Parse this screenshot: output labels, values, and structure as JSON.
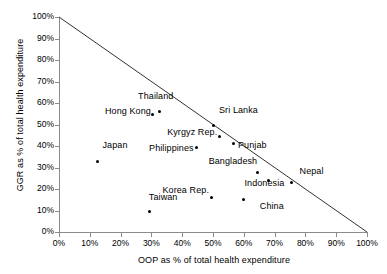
{
  "chart_data": {
    "type": "scatter",
    "title": "",
    "xlabel": "OOP as % of total health expenditure",
    "ylabel": "GGR as % of total health expenditure",
    "xlim": [
      0,
      100
    ],
    "ylim": [
      0,
      100
    ],
    "grid": false,
    "legend": "none",
    "xticks": [
      "0%",
      "10%",
      "20%",
      "30%",
      "40%",
      "50%",
      "60%",
      "70%",
      "80%",
      "90%",
      "100%"
    ],
    "xtick_values": [
      0,
      10,
      20,
      30,
      40,
      50,
      60,
      70,
      80,
      90,
      100
    ],
    "yticks": [
      "0%",
      "10%",
      "20%",
      "30%",
      "40%",
      "50%",
      "60%",
      "70%",
      "80%",
      "90%",
      "100%"
    ],
    "ytick_values": [
      0,
      10,
      20,
      30,
      40,
      50,
      60,
      70,
      80,
      90,
      100
    ],
    "annotations": [
      {
        "type": "line",
        "name": "sum-equals-100-line",
        "x": [
          0,
          100
        ],
        "y": [
          100,
          0
        ],
        "color": "#333333"
      }
    ],
    "points": [
      {
        "label": "Japan",
        "x": 12.5,
        "y": 33.0,
        "label_dx": -30,
        "label_dy": -16
      },
      {
        "label": "Taiwan",
        "x": 29.5,
        "y": 9.5,
        "label_dx": -32,
        "label_dy": -15
      },
      {
        "label": "Hong Kong",
        "x": 30.5,
        "y": 54.5,
        "label_dx": -62,
        "label_dy": -4
      },
      {
        "label": "Thailand",
        "x": 32.5,
        "y": 56.0,
        "label_dx": -46,
        "label_dy": -16
      },
      {
        "label": "Philippines",
        "x": 44.5,
        "y": 39.5,
        "label_dx": -62,
        "label_dy": 1
      },
      {
        "label": "Korea Rep.",
        "x": 49.5,
        "y": 16.0,
        "label_dx": -62,
        "label_dy": -8
      },
      {
        "label": "Sri Lanka",
        "x": 50.0,
        "y": 49.5,
        "label_dx": 6,
        "label_dy": -16
      },
      {
        "label": "Kyrgyz Rep.",
        "x": 52.0,
        "y": 44.5,
        "label_dx": -62,
        "label_dy": -4
      },
      {
        "label": "Punjab",
        "x": 56.5,
        "y": 41.0,
        "label_dx": 5,
        "label_dy": 1
      },
      {
        "label": "China",
        "x": 60.0,
        "y": 15.0,
        "label_dx": -20,
        "label_dy": 6
      },
      {
        "label": "Bangladesh",
        "x": 64.5,
        "y": 27.5,
        "label_dx": -60,
        "label_dy": -12
      },
      {
        "label": "Indonesia",
        "x": 68.0,
        "y": 24.0,
        "label_dx": -44,
        "label_dy": 3
      },
      {
        "label": "Nepal",
        "x": 75.5,
        "y": 23.0,
        "label_dx": 8,
        "label_dy": -12
      }
    ]
  },
  "colors": {
    "axis": "#8c8c8c",
    "marker": "#000000",
    "trend_line": "#333333",
    "text": "#000000",
    "background": "#ffffff"
  }
}
